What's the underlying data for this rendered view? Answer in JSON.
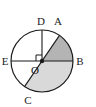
{
  "figure": {
    "kind": "circle-geometry-diagram",
    "background_color": "#ffffff",
    "stroke_color": "#1a1a1a",
    "label_color": "#1a1a1a",
    "shade_upper_color": "#b4b4b4",
    "shade_lower_color": "#d9d9d9",
    "circle": {
      "center_x": 42,
      "center_y": 61,
      "radius": 31,
      "stroke_width": 1.2
    },
    "center_point": {
      "name": "O",
      "x": 42,
      "y": 61,
      "dot_radius": 2.2
    },
    "points": [
      {
        "name": "A",
        "x": 59.5,
        "y": 35.4,
        "label_x": 58,
        "label_y": 25,
        "on_circle": true
      },
      {
        "name": "B",
        "x": 73.0,
        "y": 61.0,
        "label_x": 78,
        "label_y": 65,
        "on_circle": true
      },
      {
        "name": "C",
        "x": 24.5,
        "y": 86.6,
        "label_x": 28,
        "label_y": 105,
        "on_circle": true
      },
      {
        "name": "D",
        "x": 42.0,
        "y": 30.0,
        "label_x": 38,
        "label_y": 24,
        "on_circle": true
      },
      {
        "name": "E",
        "x": 11.0,
        "y": 61.0,
        "label_x": 2,
        "label_y": 65,
        "on_circle": true
      }
    ],
    "segments": [
      {
        "name": "diameter-EB",
        "from": "E",
        "to": "B"
      },
      {
        "name": "radius-OD",
        "from": "O",
        "to": "D"
      },
      {
        "name": "diameter-AC",
        "from": "A",
        "to": "C"
      }
    ],
    "right_angle_marker": {
      "name": "right-angle-at-O",
      "between": "OD and OE",
      "size": 6
    },
    "shaded_region": {
      "name": "shaded-sector-ABC",
      "description": "Region bounded by diameter AC and the arc from A through B to C",
      "upper_part_label": "arc A to B above horizontal diameter",
      "lower_part_label": "arc B to C below horizontal diameter"
    },
    "labels": {
      "A": "A",
      "B": "B",
      "C": "C",
      "D": "D",
      "E": "E",
      "O": "O"
    }
  }
}
